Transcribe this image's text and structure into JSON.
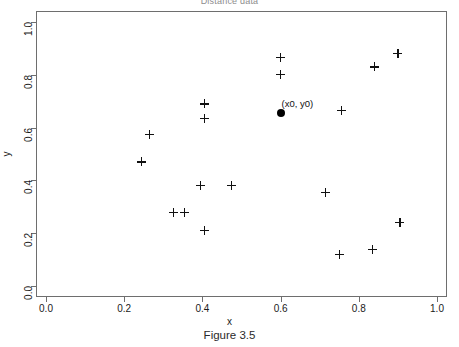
{
  "figure": {
    "title": "Distance data",
    "caption": "Figure 3.5"
  },
  "axes": {
    "xlabel": "x",
    "ylabel": "y",
    "x_ticks": [
      "0.0",
      "0.2",
      "0.4",
      "0.6",
      "0.8",
      "1.0"
    ],
    "y_ticks": [
      "0.0",
      "0.2",
      "0.4",
      "0.6",
      "0.8",
      "1.0"
    ]
  },
  "annotations": [
    {
      "text": "(x0, y0)",
      "x": 0.6,
      "y": 0.655
    }
  ],
  "chart_data": {
    "type": "scatter",
    "title": "Distance data",
    "xlabel": "x",
    "ylabel": "y",
    "xlim": [
      0.0,
      1.0
    ],
    "ylim": [
      0.0,
      1.0
    ],
    "x_ticks": [
      0.0,
      0.2,
      0.4,
      0.6,
      0.8,
      1.0
    ],
    "y_ticks": [
      0.0,
      0.2,
      0.4,
      0.6,
      0.8,
      1.0
    ],
    "grid": false,
    "legend": null,
    "series": [
      {
        "name": "data",
        "marker": "plus",
        "color": "#111111",
        "points": [
          {
            "x": 0.6,
            "y": 0.865
          },
          {
            "x": 0.6,
            "y": 0.8
          },
          {
            "x": 0.84,
            "y": 0.83
          },
          {
            "x": 0.9,
            "y": 0.88
          },
          {
            "x": 0.405,
            "y": 0.69
          },
          {
            "x": 0.405,
            "y": 0.635
          },
          {
            "x": 0.755,
            "y": 0.665
          },
          {
            "x": 0.265,
            "y": 0.575
          },
          {
            "x": 0.245,
            "y": 0.47
          },
          {
            "x": 0.395,
            "y": 0.38
          },
          {
            "x": 0.475,
            "y": 0.38
          },
          {
            "x": 0.715,
            "y": 0.355
          },
          {
            "x": 0.325,
            "y": 0.28
          },
          {
            "x": 0.355,
            "y": 0.28
          },
          {
            "x": 0.405,
            "y": 0.21
          },
          {
            "x": 0.905,
            "y": 0.24
          },
          {
            "x": 0.835,
            "y": 0.14
          },
          {
            "x": 0.75,
            "y": 0.12
          }
        ]
      },
      {
        "name": "query point",
        "marker": "filled-circle",
        "color": "#000000",
        "points": [
          {
            "x": 0.6,
            "y": 0.655
          }
        ]
      }
    ]
  }
}
